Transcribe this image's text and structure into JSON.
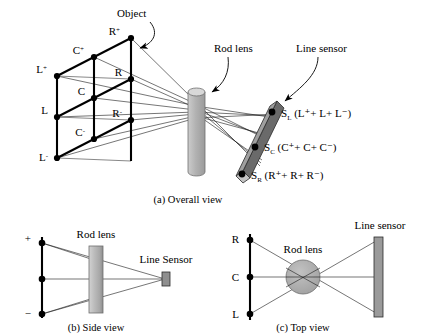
{
  "figure": {
    "panels": [
      {
        "id": "overall",
        "caption": "(a) Overall view",
        "labels": {
          "object": "Object",
          "rod_lens": "Rod lens",
          "line_sensor": "Line sensor"
        },
        "object_nodes": [
          {
            "id": "Rp",
            "base": "R",
            "sup": "+"
          },
          {
            "id": "Cp",
            "base": "C",
            "sup": "+"
          },
          {
            "id": "Lp",
            "base": "L",
            "sup": "+"
          },
          {
            "id": "R",
            "base": "R",
            "sup": ""
          },
          {
            "id": "C",
            "base": "C",
            "sup": ""
          },
          {
            "id": "L",
            "base": "L",
            "sup": ""
          },
          {
            "id": "Rm",
            "base": "R",
            "sup": "-"
          },
          {
            "id": "Cm",
            "base": "C",
            "sup": "-"
          },
          {
            "id": "Lm",
            "base": "L",
            "sup": "-"
          }
        ],
        "sensor_points": [
          {
            "name": "S",
            "sub": "L",
            "expr": "(L⁺+ L+ L⁻)"
          },
          {
            "name": "S",
            "sub": "C",
            "expr": "(C⁺+ C+ C⁻)"
          },
          {
            "name": "S",
            "sub": "R",
            "expr": "(R⁺+ R+ R⁻)"
          }
        ]
      },
      {
        "id": "side",
        "caption": "(b) Side view",
        "labels": {
          "rod_lens": "Rod lens",
          "line_sensor": "Line Sensor"
        },
        "axis_labels": [
          {
            "id": "plus",
            "text": "+"
          },
          {
            "id": "middle",
            "text": ""
          },
          {
            "id": "minus",
            "text": "−"
          }
        ]
      },
      {
        "id": "top",
        "caption": "(c) Top view",
        "labels": {
          "rod_lens": "Rod lens",
          "line_sensor": "Line sensor"
        },
        "axis_labels": [
          {
            "id": "r",
            "text": "R"
          },
          {
            "id": "c",
            "text": "C"
          },
          {
            "id": "l",
            "text": "L"
          }
        ]
      }
    ],
    "colors": {
      "lens_fill": "#b4b4b4",
      "lens_edge": "#6e6e6e",
      "sensor_front": "#9a9a9a",
      "sensor_top": "#5a5a5a",
      "stroke": "#000000",
      "background": "#ffffff"
    }
  }
}
